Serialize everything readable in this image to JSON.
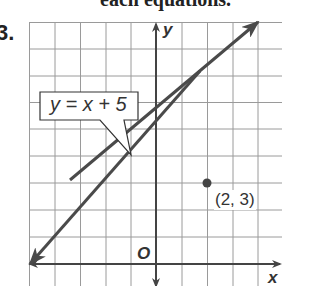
{
  "heading": "each equations.",
  "problem_number": "3.",
  "graph": {
    "line_label": "y = x + 5",
    "point_label": "(2, 3)",
    "x_axis_label": "x",
    "y_axis_label": "y",
    "origin_label": "O",
    "line": {
      "slope": 1,
      "intercept": 5
    },
    "point": {
      "x": 2,
      "y": 3
    },
    "x_range": [
      -5,
      5
    ],
    "y_range": [
      -1,
      9
    ]
  },
  "colors": {
    "grid": "#9a9a9a",
    "axis": "#444444",
    "line": "#4a4a4a",
    "point": "#444444"
  }
}
